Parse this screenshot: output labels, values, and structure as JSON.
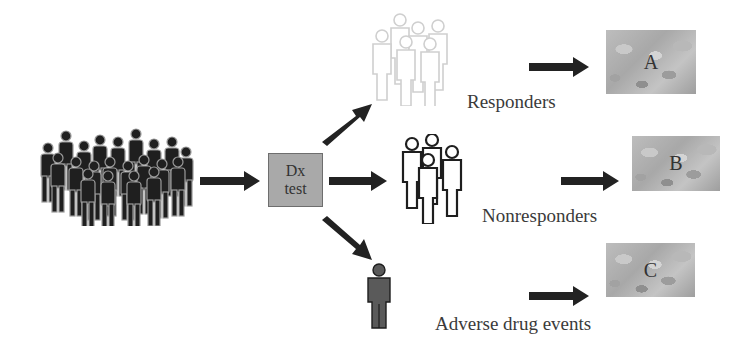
{
  "diagram": {
    "type": "pharmacogenomic-stratification-flow",
    "source_population": {
      "icon": "crowd-icon",
      "color": "#1f1f1f"
    },
    "test": {
      "line1": "Dx",
      "line2": "test",
      "fill": "#a9a9a9"
    },
    "branches": [
      {
        "id": "responders",
        "label": "Responders",
        "group_icon": "people-group-outline-light-icon",
        "group_color": "#cfcfcf",
        "drug_label": "A"
      },
      {
        "id": "nonresponders",
        "label": "Nonresponders",
        "group_icon": "people-group-outline-icon",
        "group_color": "#1e1e1e",
        "drug_label": "B"
      },
      {
        "id": "adverse",
        "label": "Adverse drug events",
        "group_icon": "single-person-icon",
        "group_color": "#5a5a5a",
        "drug_label": "C"
      }
    ],
    "arrow_color": "#222222"
  }
}
